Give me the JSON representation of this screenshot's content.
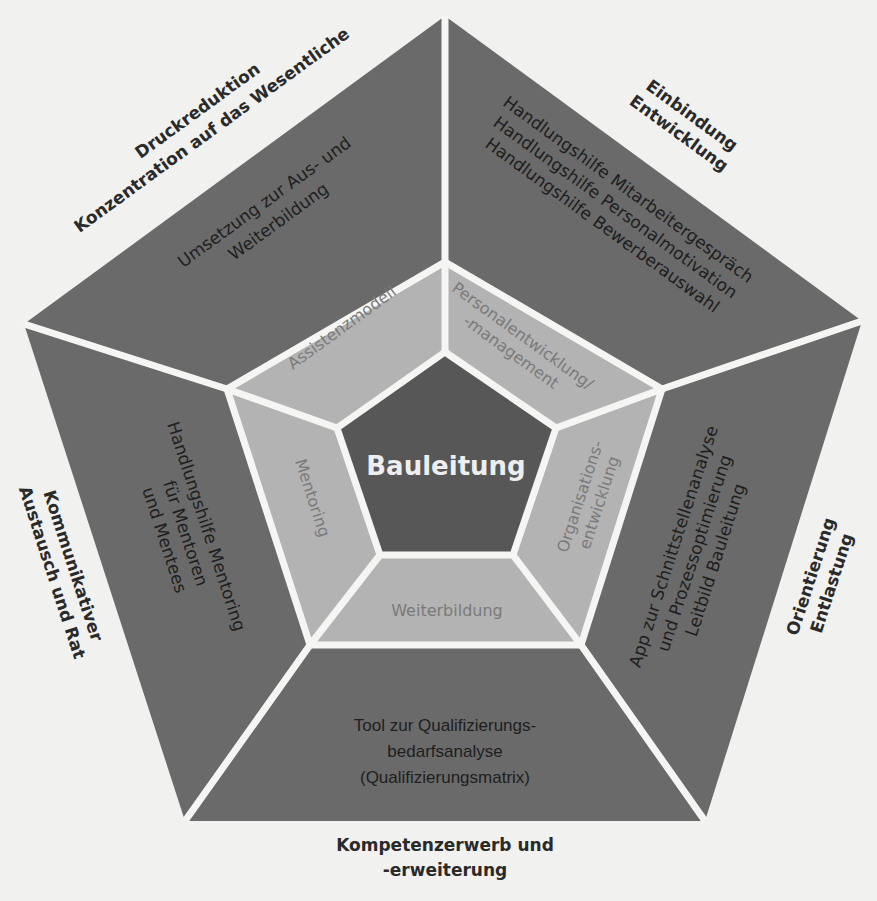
{
  "diagram": {
    "center": {
      "label": "Bauleitung"
    },
    "middle_ring": {
      "top_left": "Assistenzmodell",
      "top_right_line1": "Personalentwicklung/",
      "top_right_line2": "-management",
      "right_line1": "Organisations-",
      "right_line2": "entwicklung",
      "bottom": "Weiterbildung",
      "left": "Mentoring"
    },
    "outer_ring": {
      "top_left_line1": "Umsetzung zur Aus- und",
      "top_left_line2": "Weiterbildung",
      "top_right_line1": "Handlungshilfe Mitarbeitergespräch",
      "top_right_line2": "Handlungshilfe Personalmotivation",
      "top_right_line3": "Handlungshilfe Bewerberauswahl",
      "right_line1": "App zur Schnittstellenanalyse",
      "right_line2": "und Prozessoptimierung",
      "right_line3": "Leitbild Bauleitung",
      "bottom_line1": "Tool zur Qualifizierungs-",
      "bottom_line2": "bedarfsanalyse",
      "bottom_line3": "(Qualifizierungsmatrix)",
      "left_line1": "Handlungshilfe Mentoring",
      "left_line2": "für Mentoren",
      "left_line3": "und Mentees"
    },
    "outside_labels": {
      "top_left_line1": "Druckreduktion",
      "top_left_line2": "Konzentration auf das Wesentliche",
      "top_right_line1": "Einbindung",
      "top_right_line2": "Entwicklung",
      "right_line1": "Orientierung",
      "right_line2": "Entlastung",
      "bottom_line1": "Kompetenzerwerb und",
      "bottom_line2": "-erweiterung",
      "left_line1": "Kommunikativer",
      "left_line2": "Austausch und Rat"
    },
    "colors": {
      "outer": "#6a6a6a",
      "middle": "#b3b3b3",
      "core": "#575757",
      "separator": "#f5f5f3",
      "background": "#f1f1ef"
    }
  }
}
